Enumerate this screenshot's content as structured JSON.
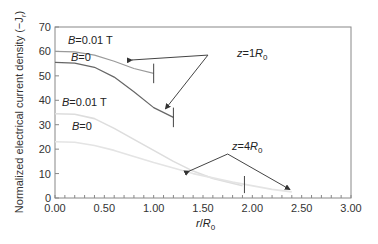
{
  "chart_data": {
    "type": "line",
    "title": "",
    "xlabel": "r/R0",
    "ylabel": "Normalized electrical current density (-Jr)",
    "xlim": [
      0,
      3
    ],
    "ylim": [
      0,
      70
    ],
    "xticks": [
      "0.00",
      "0.50",
      "1.00",
      "1.50",
      "2.00",
      "2.50",
      "3.00"
    ],
    "yticks": [
      "0",
      "10",
      "20",
      "30",
      "40",
      "50",
      "60",
      "70"
    ],
    "grid": false,
    "series": [
      {
        "name": "z=1R0, B=0.01 T",
        "color": "#9a9a9a",
        "x": [
          0,
          0.2,
          0.4,
          0.6,
          0.8,
          1.0
        ],
        "y": [
          60,
          59.8,
          58.5,
          56,
          53,
          51
        ]
      },
      {
        "name": "z=1R0, B=0",
        "color": "#666666",
        "x": [
          0,
          0.2,
          0.4,
          0.6,
          0.8,
          1.0,
          1.2
        ],
        "y": [
          55.5,
          55.2,
          53.5,
          49.5,
          43.5,
          37,
          33
        ]
      },
      {
        "name": "z=4R0, B=0.01 T",
        "color": "#dddddd",
        "x": [
          0,
          0.2,
          0.4,
          0.6,
          0.8,
          1.0,
          1.2,
          1.4,
          1.6,
          1.9
        ],
        "y": [
          34.5,
          34.3,
          32.5,
          28.5,
          24,
          19.5,
          15,
          11,
          8,
          5
        ]
      },
      {
        "name": "z=4R0, B=0",
        "color": "#e4e4e4",
        "x": [
          0,
          0.2,
          0.4,
          0.6,
          0.8,
          1.0,
          1.4,
          1.8,
          2.2,
          2.4
        ],
        "y": [
          23,
          22.8,
          21.5,
          19.5,
          17,
          14.5,
          10,
          6.5,
          3.5,
          2.5
        ]
      }
    ],
    "annotations": [
      {
        "text": "B=0.01 T",
        "group": "z=1R0"
      },
      {
        "text": "B=0",
        "group": "z=1R0"
      },
      {
        "text": "z=1R0"
      },
      {
        "text": "B=0.01 T",
        "group": "z=4R0"
      },
      {
        "text": "B=0",
        "group": "z=4R0"
      },
      {
        "text": "z=4R0"
      }
    ]
  },
  "labels": {
    "b001": "B=0.01 T",
    "b0": "B=0",
    "z1": "z=1R",
    "z4": "z=4R",
    "sub0": "0",
    "xlabel_r": "r/R",
    "ylabel": "Normalized electrical current density (−J"
  }
}
